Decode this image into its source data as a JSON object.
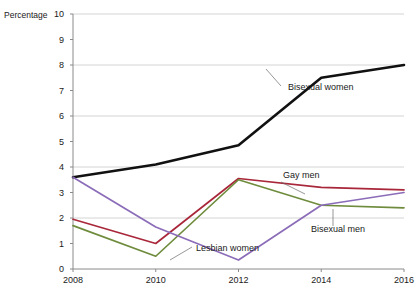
{
  "chart_data": {
    "type": "line",
    "title": "",
    "xlabel": "",
    "ylabel": "Percentage",
    "categories": [
      2008,
      2010,
      2012,
      2014,
      2016
    ],
    "x_tick_labels": [
      "2008",
      "2010",
      "2012",
      "2014",
      "2016"
    ],
    "y_tick_labels": [
      "0",
      "1",
      "2",
      "3",
      "4",
      "5",
      "6",
      "7",
      "8",
      "9",
      "10"
    ],
    "ylim": [
      0,
      10
    ],
    "y_gridlines": [
      2,
      4,
      6,
      8,
      10
    ],
    "grid": true,
    "legend_position": "inline-annotations",
    "series": [
      {
        "name": "Bisexual women",
        "color": "#111111",
        "width": 2.6,
        "values": [
          3.6,
          4.1,
          4.85,
          7.5,
          8.0
        ],
        "label_x": 288,
        "label_y": 90,
        "leader": [
          281,
          86,
          266,
          69
        ]
      },
      {
        "name": "Gay men",
        "color": "#A8273A",
        "width": 1.7,
        "values": [
          1.95,
          1.0,
          3.55,
          3.2,
          3.1
        ],
        "label_x": 283,
        "label_y": 178,
        "leader": [
          281,
          182,
          305,
          194
        ]
      },
      {
        "name": "Bisexual men",
        "color": "#6E8C3C",
        "width": 1.7,
        "values": [
          1.7,
          0.5,
          3.5,
          2.5,
          2.4
        ],
        "label_x": 311,
        "label_y": 232,
        "leader": [
          333,
          226,
          333,
          209
        ]
      },
      {
        "name": "Lesbian women",
        "color": "#8B6CB8",
        "width": 1.7,
        "values": [
          3.6,
          1.65,
          0.35,
          2.5,
          3.0
        ],
        "label_x": 196,
        "label_y": 251,
        "leader": [
          192,
          247,
          170,
          260
        ]
      }
    ],
    "plot_area": {
      "left": 73,
      "right": 404,
      "top": 14,
      "bottom": 269
    }
  }
}
